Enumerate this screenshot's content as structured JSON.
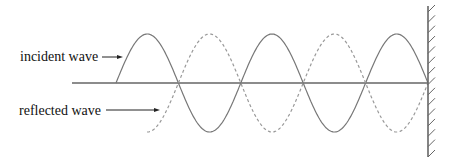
{
  "labels": {
    "incident": "incident wave",
    "reflected": "reflected wave"
  },
  "diagram": {
    "type": "standing-wave-reflection",
    "axis": {
      "x_start": 72,
      "x_end": 428,
      "y": 83
    },
    "wall": {
      "x": 428,
      "y_top": 6,
      "y_bottom": 157,
      "hatch_count": 15
    },
    "incident_wave": {
      "style": "solid",
      "x_start": 116,
      "x_end": 428,
      "amplitude": 49,
      "half_period": 62.4,
      "color": "#777777"
    },
    "reflected_wave": {
      "style": "dashed",
      "x_start": 147,
      "x_end": 428,
      "amplitude": 49,
      "half_period": 62.4,
      "color": "#999999"
    },
    "colors": {
      "axis": "#666666",
      "wall": "#666666",
      "arrow": "#222222"
    }
  }
}
